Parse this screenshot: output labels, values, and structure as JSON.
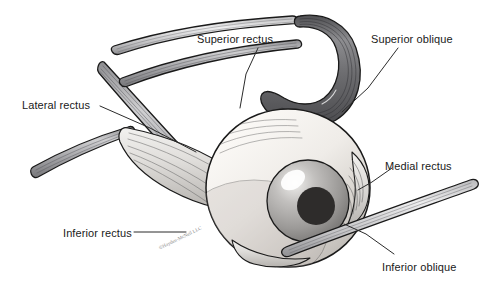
{
  "figure": {
    "background_color": "#ffffff",
    "width": 498,
    "height": 289
  },
  "labels": [
    {
      "id": "superior-rectus",
      "text": "Superior rectus",
      "x": 197,
      "y": 33
    },
    {
      "id": "superior-oblique",
      "text": "Superior oblique",
      "x": 371,
      "y": 33
    },
    {
      "id": "lateral-rectus",
      "text": "Lateral rectus",
      "x": 22,
      "y": 99
    },
    {
      "id": "medial-rectus",
      "text": "Medial rectus",
      "x": 385,
      "y": 160
    },
    {
      "id": "inferior-rectus",
      "text": "Inferior rectus",
      "x": 63,
      "y": 227
    },
    {
      "id": "inferior-oblique",
      "text": "Inferior oblique",
      "x": 382,
      "y": 261
    }
  ],
  "watermark": {
    "text": "©Hayden-McNeil LLC",
    "x": 158,
    "y": 246
  },
  "palette": {
    "outline": "#1a1a1a",
    "muscle_dark": "#6f6f72",
    "muscle_mid": "#9a9a9d",
    "muscle_light": "#c9c9cb",
    "muscle_pale": "#e6e6e6",
    "sclera_light": "#f3f0ec",
    "sclera_shadow": "#c3bfba",
    "iris_light": "#e3e1df",
    "iris_mid": "#a3a1a0",
    "iris_dark": "#7b7977",
    "pupil": "#2e2c2b",
    "highlight": "#ffffff",
    "leader_line": "#2b2b2b",
    "label_text": "#1a1a1a"
  },
  "structures": [
    {
      "id": "superior-rectus-band",
      "name": "Superior rectus muscle"
    },
    {
      "id": "levator-band",
      "name": "Levator palpebrae muscle"
    },
    {
      "id": "superior-oblique-band",
      "name": "Superior oblique muscle with trochlea"
    },
    {
      "id": "lateral-rectus-band",
      "name": "Lateral rectus muscle"
    },
    {
      "id": "medial-rectus-fan",
      "name": "Medial rectus muscle insertion"
    },
    {
      "id": "inferior-rectus-band",
      "name": "Inferior rectus muscle"
    },
    {
      "id": "inferior-oblique-band",
      "name": "Inferior oblique muscle"
    },
    {
      "id": "eyeball-globe",
      "name": "Eyeball (globe/sclera)"
    },
    {
      "id": "iris",
      "name": "Iris"
    },
    {
      "id": "pupil",
      "name": "Pupil"
    }
  ]
}
